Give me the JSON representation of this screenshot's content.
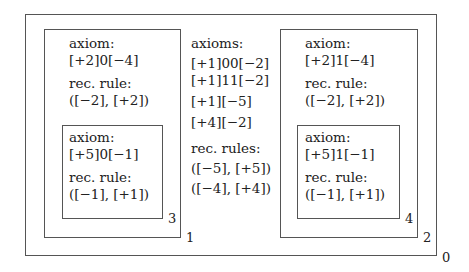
{
  "diagram": {
    "outer": {
      "label": "0"
    },
    "box1": {
      "label": "1",
      "axiom_heading": "axiom:",
      "axiom": "[+2]0[−4]",
      "rule_heading": "rec. rule:",
      "rule": "([−2], [+2])"
    },
    "box3": {
      "label": "3",
      "axiom_heading": "axiom:",
      "axiom": "[+5]0[−1]",
      "rule_heading": "rec. rule:",
      "rule": "([−1], [+1])"
    },
    "center": {
      "axioms_heading": "axioms:",
      "axioms": [
        "[+1]00[−2]",
        "[+1]11[−2]",
        "[+1][−5]",
        "[+4][−2]"
      ],
      "rules_heading": "rec. rules:",
      "rules": [
        "([−5], [+5])",
        "([−4], [+4])"
      ]
    },
    "box2": {
      "label": "2",
      "axiom_heading": "axiom:",
      "axiom": "[+2]1[−4]",
      "rule_heading": "rec. rule:",
      "rule": "([−2], [+2])"
    },
    "box4": {
      "label": "4",
      "axiom_heading": "axiom:",
      "axiom": "[+5]1[−1]",
      "rule_heading": "rec. rule:",
      "rule": "([−1], [+1])"
    }
  }
}
